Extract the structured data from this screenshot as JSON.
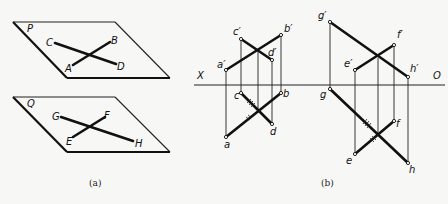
{
  "figure_a": {
    "caption": "(a)",
    "plane_p": {
      "label": "P",
      "points": {
        "C": "C",
        "B": "B",
        "A": "A",
        "D": "D"
      }
    },
    "plane_q": {
      "label": "Q",
      "points": {
        "G": "G",
        "F": "F",
        "E": "E",
        "H": "H"
      }
    }
  },
  "figure_b": {
    "caption": "(b)",
    "axis": {
      "left_label": "X",
      "right_label": "O"
    },
    "left_projection": {
      "front_view": {
        "a": "a′",
        "b": "b′",
        "c": "c′",
        "d": "d′"
      },
      "top_view": {
        "a": "a",
        "b": "b",
        "c": "c",
        "d": "d"
      }
    },
    "right_projection": {
      "front_view": {
        "g": "g′",
        "h": "h′",
        "e": "e′",
        "f": "f′"
      },
      "top_view": {
        "g": "g",
        "h": "h",
        "e": "e",
        "f": "f"
      }
    }
  }
}
